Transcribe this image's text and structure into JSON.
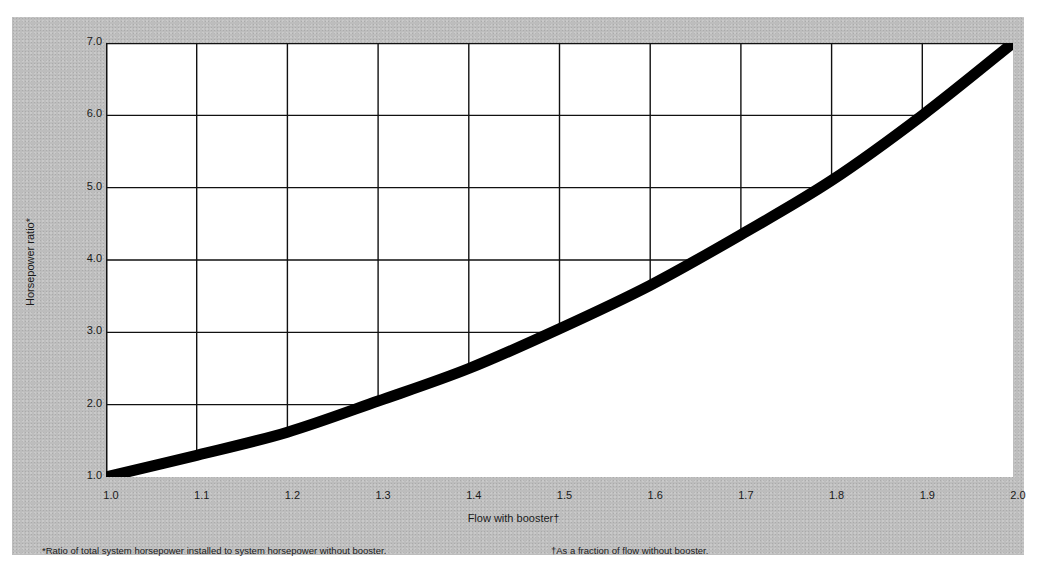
{
  "chart_data": {
    "type": "line",
    "title": "",
    "xlabel": "Flow with booster†",
    "ylabel": "Horsepower ratio*",
    "x": [
      1.0,
      1.1,
      1.2,
      1.3,
      1.4,
      1.5,
      1.6,
      1.7,
      1.8,
      1.9,
      2.0
    ],
    "series": [
      {
        "name": "Horsepower ratio",
        "values": [
          1.0,
          1.3,
          1.62,
          2.05,
          2.5,
          3.05,
          3.65,
          4.35,
          5.1,
          6.0,
          7.0
        ]
      }
    ],
    "xlim": [
      1.0,
      2.0
    ],
    "ylim": [
      1.0,
      7.0
    ],
    "xticks": [
      "1.0",
      "1.1",
      "1.2",
      "1.3",
      "1.4",
      "1.5",
      "1.6",
      "1.7",
      "1.8",
      "1.9",
      "2.0"
    ],
    "yticks": [
      "1.0",
      "2.0",
      "3.0",
      "4.0",
      "5.0",
      "6.0",
      "7.0"
    ],
    "grid": true,
    "grid_note": "grid drawn only above/left of the curve",
    "legend": null,
    "footnotes": [
      "*Ratio of total system horsepower installed to system horsepower without booster.",
      "†As a fraction of flow without booster."
    ]
  },
  "labels": {
    "xlabel": "Flow with booster†",
    "ylabel": "Horsepower ratio*",
    "footnote_1": "*Ratio of total system horsepower installed to system horsepower without booster.",
    "footnote_2": "†As a fraction of flow without booster."
  },
  "colors": {
    "paper": "#bdbdbd",
    "plot_bg": "#ffffff",
    "curve": "#000000",
    "grid": "#111111"
  }
}
